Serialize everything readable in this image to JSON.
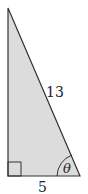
{
  "diagram": {
    "type": "right-triangle",
    "fill_color": "#dcdcdc",
    "stroke_color": "#333333",
    "vertices": {
      "top": [
        8,
        8
      ],
      "right_angle": [
        8,
        176
      ],
      "base_right": [
        80,
        176
      ]
    },
    "labels": {
      "hypotenuse": "13",
      "base": "5",
      "angle": "θ"
    },
    "right_angle_marker": true
  }
}
